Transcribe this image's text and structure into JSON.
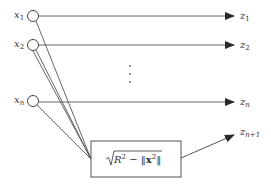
{
  "diagram": {
    "type": "network",
    "colors": {
      "stroke": "#3a3a3a",
      "text": "#333333",
      "background": "#ffffff"
    },
    "inputs": [
      {
        "id": "x1",
        "var": "x",
        "sub": "1"
      },
      {
        "id": "x2",
        "var": "x",
        "sub": "2"
      },
      {
        "id": "xn",
        "var": "x",
        "sub": "n"
      }
    ],
    "outputs": [
      {
        "id": "z1",
        "var": "z",
        "sub": "1"
      },
      {
        "id": "z2",
        "var": "z",
        "sub": "2"
      },
      {
        "id": "zn",
        "var": "z",
        "sub": "n"
      },
      {
        "id": "zn1",
        "var": "z",
        "sub": "n+1"
      }
    ],
    "ellipsis": "⋮",
    "box": {
      "formula_prefix": "R",
      "formula_exp": "2",
      "formula_minus": " − ‖",
      "formula_bold": "x",
      "formula_bold_exp": "2",
      "formula_suffix": "‖"
    }
  }
}
